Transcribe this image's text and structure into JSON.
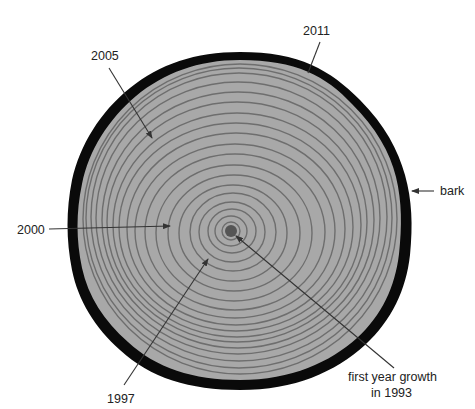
{
  "diagram": {
    "colors": {
      "wood": "#a8a8a8",
      "ring": "#6e6e6e",
      "bark": "#0a0a0a",
      "pith": "#555555",
      "label": "#222222",
      "leader": "#333333"
    },
    "labels": {
      "year_2011": "2011",
      "year_2005": "2005",
      "year_2000": "2000",
      "year_1997": "1997",
      "bark": "bark",
      "first_year_line1": "first year growth",
      "first_year_line2": "in 1993"
    },
    "ring_count": 19
  }
}
